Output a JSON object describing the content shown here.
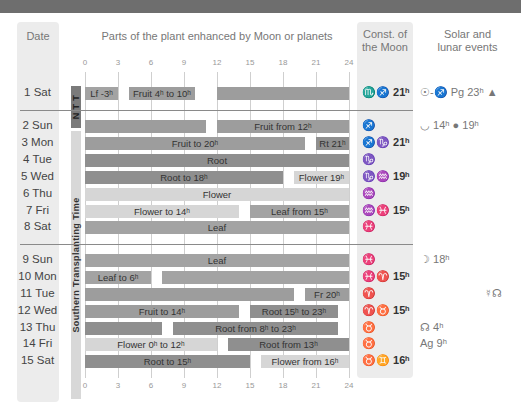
{
  "headers": {
    "date": "Date",
    "chart": "Parts of the plant enhanced by Moon or planets",
    "const_line1": "Const. of",
    "const_line2": "the Moon",
    "events_line1": "Solar and",
    "events_line2": "lunar events"
  },
  "periods": {
    "ntt": "N T T",
    "southern": "Southern Transplanting Time"
  },
  "colors": {
    "topbar": "#6e6e6e",
    "root": "#8f8f8f",
    "fruit": "#9d9d9d",
    "leaf": "#a3a3a3",
    "flower": "#d6d6d6",
    "column_bg": "#ececec"
  },
  "rows": [
    {
      "date": "1 Sat",
      "const": "♏♐",
      "const_time": "21ʰ",
      "events": "☉-♐ Pg 23ʰ ▲"
    },
    {
      "date": "2 Sun",
      "const": "♐",
      "const_time": "",
      "events": "◡ 14ʰ ● 19ʰ"
    },
    {
      "date": "3 Mon",
      "const": "♐♑",
      "const_time": "21ʰ",
      "events": ""
    },
    {
      "date": "4 Tue",
      "const": "♑",
      "const_time": "",
      "events": ""
    },
    {
      "date": "5 Wed",
      "const": "♑♒",
      "const_time": "19ʰ",
      "events": ""
    },
    {
      "date": "6 Thu",
      "const": "♒",
      "const_time": "",
      "events": ""
    },
    {
      "date": "7 Fri",
      "const": "♒♓",
      "const_time": "15ʰ",
      "events": ""
    },
    {
      "date": "8 Sat",
      "const": "♓",
      "const_time": "",
      "events": ""
    },
    {
      "date": "9 Sun",
      "const": "♓",
      "const_time": "",
      "events": "☽ 18ʰ"
    },
    {
      "date": "10 Mon",
      "const": "♓♈",
      "const_time": "15ʰ",
      "events": ""
    },
    {
      "date": "11 Tue",
      "const": "♈",
      "const_time": "",
      "events": "☿☊"
    },
    {
      "date": "12 Wed",
      "const": "♈♉",
      "const_time": "15ʰ",
      "events": ""
    },
    {
      "date": "13 Thu",
      "const": "♉",
      "const_time": "",
      "events": "☊ 4ʰ"
    },
    {
      "date": "14 Fri",
      "const": "♉",
      "const_time": "",
      "events": "Ag 9ʰ"
    },
    {
      "date": "15 Sat",
      "const": "♉♊",
      "const_time": "16ʰ",
      "events": ""
    }
  ],
  "chart_data": {
    "type": "bar",
    "subtype": "horizontal-gantt",
    "title": "Parts of the plant enhanced by Moon or planets",
    "xlabel": "Hour of day",
    "x_ticks": [
      0,
      3,
      6,
      9,
      12,
      15,
      18,
      21,
      24
    ],
    "xlim": [
      0,
      24
    ],
    "grid": true,
    "categories": [
      "1 Sat",
      "2 Sun",
      "3 Mon",
      "4 Tue",
      "5 Wed",
      "6 Thu",
      "7 Fri",
      "8 Sat",
      "9 Sun",
      "10 Mon",
      "11 Tue",
      "12 Wed",
      "13 Thu",
      "14 Fri",
      "15 Sat"
    ],
    "bars": [
      {
        "row": 0,
        "start": 0,
        "end": 3,
        "type": "leaf",
        "label": "Lf -3ʰ"
      },
      {
        "row": 0,
        "start": 4,
        "end": 10,
        "type": "fruit",
        "label": "Fruit 4ʰ to 10ʰ"
      },
      {
        "row": 0,
        "start": 12,
        "end": 24,
        "type": "fruit",
        "label": ""
      },
      {
        "row": 1,
        "start": 0,
        "end": 11,
        "type": "fruit",
        "label": ""
      },
      {
        "row": 1,
        "start": 12,
        "end": 24,
        "type": "fruit",
        "label": "Fruit from 12ʰ"
      },
      {
        "row": 2,
        "start": 0,
        "end": 20,
        "type": "fruit",
        "label": "Fruit to 20ʰ"
      },
      {
        "row": 2,
        "start": 21,
        "end": 24,
        "type": "root",
        "label": "Rt 21ʰ"
      },
      {
        "row": 3,
        "start": 0,
        "end": 24,
        "type": "root",
        "label": "Root"
      },
      {
        "row": 4,
        "start": 0,
        "end": 18,
        "type": "root",
        "label": "Root to 18ʰ"
      },
      {
        "row": 4,
        "start": 19,
        "end": 24,
        "type": "flower",
        "label": "Flower 19ʰ"
      },
      {
        "row": 5,
        "start": 0,
        "end": 24,
        "type": "flower",
        "label": "Flower"
      },
      {
        "row": 6,
        "start": 0,
        "end": 14,
        "type": "flower",
        "label": "Flower to 14ʰ"
      },
      {
        "row": 6,
        "start": 15,
        "end": 24,
        "type": "leaf",
        "label": "Leaf from 15ʰ"
      },
      {
        "row": 7,
        "start": 0,
        "end": 24,
        "type": "leaf",
        "label": "Leaf"
      },
      {
        "row": 8,
        "start": 0,
        "end": 24,
        "type": "leaf",
        "label": "Leaf"
      },
      {
        "row": 9,
        "start": 0,
        "end": 6,
        "type": "leaf",
        "label": "Leaf to 6ʰ"
      },
      {
        "row": 9,
        "start": 7,
        "end": 24,
        "type": "leaf",
        "label": ""
      },
      {
        "row": 10,
        "start": 0,
        "end": 19,
        "type": "fruit",
        "label": ""
      },
      {
        "row": 10,
        "start": 20,
        "end": 24,
        "type": "fruit",
        "label": "Fr 20ʰ"
      },
      {
        "row": 11,
        "start": 0,
        "end": 14,
        "type": "fruit",
        "label": "Fruit to 14ʰ"
      },
      {
        "row": 11,
        "start": 15,
        "end": 23,
        "type": "root",
        "label": "Root 15ʰ to 23ʰ"
      },
      {
        "row": 12,
        "start": 0,
        "end": 7,
        "type": "root",
        "label": ""
      },
      {
        "row": 12,
        "start": 8,
        "end": 23,
        "type": "root",
        "label": "Root from 8ʰ to 23ʰ"
      },
      {
        "row": 13,
        "start": 0,
        "end": 12,
        "type": "flower",
        "label": "Flower 0ʰ to 12ʰ"
      },
      {
        "row": 13,
        "start": 13,
        "end": 24,
        "type": "root",
        "label": "Root from 13ʰ"
      },
      {
        "row": 14,
        "start": 0,
        "end": 15,
        "type": "root",
        "label": "Root to 15ʰ"
      },
      {
        "row": 14,
        "start": 16,
        "end": 24,
        "type": "flower",
        "label": "Flower from 16ʰ"
      }
    ],
    "legend": [
      "root",
      "fruit",
      "leaf",
      "flower"
    ]
  }
}
